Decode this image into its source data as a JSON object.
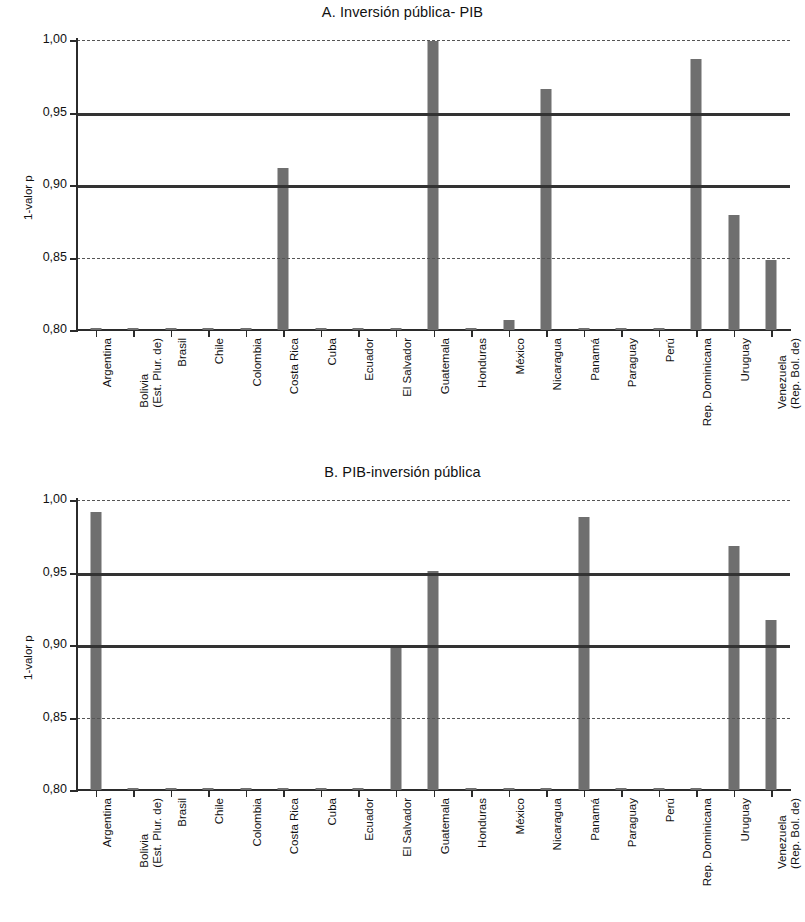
{
  "figure": {
    "categories": [
      {
        "label": "Argentina",
        "line2": ""
      },
      {
        "label": "Bolivia",
        "line2": "(Est. Plur. de)"
      },
      {
        "label": "Brasil",
        "line2": ""
      },
      {
        "label": "Chile",
        "line2": ""
      },
      {
        "label": "Colombia",
        "line2": ""
      },
      {
        "label": "Costa Rica",
        "line2": ""
      },
      {
        "label": "Cuba",
        "line2": ""
      },
      {
        "label": "Ecuador",
        "line2": ""
      },
      {
        "label": "El Salvador",
        "line2": ""
      },
      {
        "label": "Guatemala",
        "line2": ""
      },
      {
        "label": "Honduras",
        "line2": ""
      },
      {
        "label": "México",
        "line2": ""
      },
      {
        "label": "Nicaragua",
        "line2": ""
      },
      {
        "label": "Panamá",
        "line2": ""
      },
      {
        "label": "Paraguay",
        "line2": ""
      },
      {
        "label": "Perú",
        "line2": ""
      },
      {
        "label": "Rep. Dominicana",
        "line2": ""
      },
      {
        "label": "Uruguay",
        "line2": ""
      },
      {
        "label": "Venezuela",
        "line2": "(Rep. Bol. de)"
      }
    ],
    "ytick_labels": [
      "1,00",
      "0,95",
      "0,90",
      "0,85",
      "0,80"
    ],
    "ylabel": "1-valor p",
    "bar_color": "#6f6f6f",
    "threshold_color": "#333333"
  },
  "chart_data": [
    {
      "type": "bar",
      "title": "A. Inversión pública- PIB",
      "xlabel": "",
      "ylabel": "1-valor p",
      "ylim": [
        0.8,
        1.0
      ],
      "yticks": [
        0.8,
        0.85,
        0.9,
        0.95,
        1.0
      ],
      "grid": "horizontal reference lines at 0.90 and 0.95 (solid), 0.85 and 1.00 (dashed)",
      "legend": "none",
      "categories": [
        "Argentina",
        "Bolivia (Est. Plur. de)",
        "Brasil",
        "Chile",
        "Colombia",
        "Costa Rica",
        "Cuba",
        "Ecuador",
        "El Salvador",
        "Guatemala",
        "Honduras",
        "México",
        "Nicaragua",
        "Panamá",
        "Paraguay",
        "Perú",
        "Rep. Dominicana",
        "Uruguay",
        "Venezuela (Rep. Bol. de)"
      ],
      "values": [
        0.801,
        0.801,
        0.801,
        0.801,
        0.801,
        0.912,
        0.801,
        0.801,
        0.801,
        0.999,
        0.801,
        0.807,
        0.966,
        0.801,
        0.801,
        0.801,
        0.987,
        0.879,
        0.848
      ]
    },
    {
      "type": "bar",
      "title": "B. PIB-inversión pública",
      "xlabel": "",
      "ylabel": "1-valor p",
      "ylim": [
        0.8,
        1.0
      ],
      "yticks": [
        0.8,
        0.85,
        0.9,
        0.95,
        1.0
      ],
      "grid": "horizontal reference lines at 0.90 and 0.95 (solid), 0.85 and 1.00 (dashed)",
      "legend": "none",
      "categories": [
        "Argentina",
        "Bolivia (Est. Plur. de)",
        "Brasil",
        "Chile",
        "Colombia",
        "Costa Rica",
        "Cuba",
        "Ecuador",
        "El Salvador",
        "Guatemala",
        "Honduras",
        "México",
        "Nicaragua",
        "Panamá",
        "Paraguay",
        "Perú",
        "Rep. Dominicana",
        "Uruguay",
        "Venezuela (Rep. Bol. de)"
      ],
      "values": [
        0.992,
        0.801,
        0.801,
        0.801,
        0.801,
        0.801,
        0.801,
        0.801,
        0.899,
        0.951,
        0.801,
        0.801,
        0.801,
        0.988,
        0.801,
        0.801,
        0.801,
        0.968,
        0.917
      ]
    }
  ]
}
